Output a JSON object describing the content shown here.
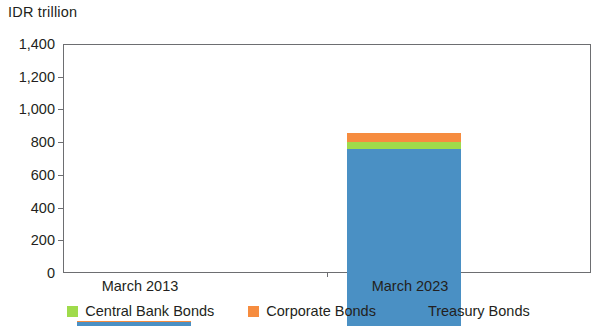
{
  "chart_data": {
    "type": "bar",
    "stacked": true,
    "title": "",
    "subtitle": "",
    "xlabel": "",
    "ylabel": "IDR trillion",
    "categories": [
      "March 2013",
      "March 2023"
    ],
    "series": [
      {
        "name": "Treasury Bonds",
        "color": "#4a90c4",
        "values": [
          22,
          1083
        ]
      },
      {
        "name": "Central Bank Bonds",
        "color": "#9fdb4b",
        "values": [
          3,
          42
        ]
      },
      {
        "name": "Corporate Bonds",
        "color": "#f68c3f",
        "values": [
          5,
          55
        ]
      }
    ],
    "stack_order": [
      "Treasury Bonds",
      "Central Bank Bonds",
      "Corporate Bonds"
    ],
    "totals": [
      30,
      1180
    ],
    "ylim": [
      0,
      1400
    ],
    "yticks": [
      0,
      200,
      400,
      600,
      800,
      1000,
      1200,
      1400
    ],
    "ytick_labels": [
      "0",
      "200",
      "400",
      "600",
      "800",
      "1,000",
      "1,200",
      "1,400"
    ],
    "grid": false,
    "legend_position": "bottom"
  },
  "axis": {
    "unit_title": "IDR trillion",
    "y_labels": [
      "1,400",
      "1,200",
      "1,000",
      "800",
      "600",
      "400",
      "200",
      "0"
    ],
    "x_labels": {
      "first": "March 2013",
      "second": "March 2023"
    }
  },
  "legend": {
    "items": [
      {
        "label": "Central Bank Bonds",
        "color": "#9fdb4b",
        "swatch_name": "legend-swatch-central-bank-bonds"
      },
      {
        "label": "Corporate Bonds",
        "color": "#f68c3f",
        "swatch_name": "legend-swatch-corporate-bonds"
      },
      {
        "label": "Treasury Bonds",
        "color": "#4a90c4",
        "swatch_name": "legend-swatch-treasury-bonds"
      }
    ]
  },
  "colors": {
    "treasury": "#4a90c4",
    "central_bank": "#9fdb4b",
    "corporate": "#f68c3f",
    "axis_line": "#6d6e71",
    "text": "#231f20",
    "background": "#ffffff"
  }
}
